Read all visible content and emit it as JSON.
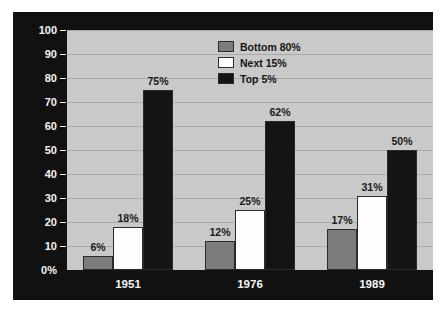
{
  "chart_data": {
    "type": "bar",
    "title": "",
    "subtitle": "",
    "xlabel": "",
    "ylabel": "Concentration of Dollars Given (percent)",
    "categories": [
      "1951",
      "1976",
      "1989"
    ],
    "series": [
      {
        "name": "Bottom 80%",
        "color": "#7c7c7c",
        "values": [
          6,
          12,
          17
        ],
        "labels": [
          "6%",
          "12%",
          "17%"
        ]
      },
      {
        "name": "Next 15%",
        "color": "#fdfdfd",
        "values": [
          18,
          25,
          31
        ],
        "labels": [
          "18%",
          "25%",
          "31%"
        ]
      },
      {
        "name": "Top 5%",
        "color": "#141414",
        "values": [
          75,
          62,
          50
        ],
        "labels": [
          "75%",
          "62%",
          "50%"
        ]
      }
    ],
    "ylim": [
      0,
      100
    ],
    "ytick_values": [
      0,
      10,
      20,
      30,
      40,
      50,
      60,
      70,
      80,
      90,
      100
    ],
    "ytick_labels": [
      "0%",
      "10",
      "20",
      "30",
      "40",
      "50",
      "60",
      "70",
      "80",
      "90",
      "100"
    ],
    "grid": true,
    "legend_position": "top-center",
    "plot_background": "#c9c9c9",
    "frame_background": "#111111",
    "gridline_color": "#a9a9a9",
    "axis_text_color": "#f4f4f4",
    "value_label_color": "#1a1a1a"
  }
}
